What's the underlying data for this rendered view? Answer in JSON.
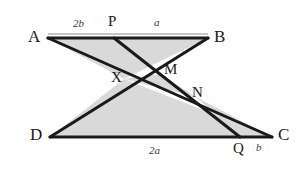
{
  "figure": {
    "background_color": "#fefefe",
    "stroke_color": "#1a1a1a",
    "fill_color": "#d9d9d9",
    "width": 306,
    "height": 170
  },
  "vertices": {
    "A": {
      "label": "A",
      "x": 48,
      "y": 38
    },
    "B": {
      "label": "B",
      "x": 208,
      "y": 38
    },
    "C": {
      "label": "C",
      "x": 272,
      "y": 137
    },
    "D": {
      "label": "D",
      "x": 50,
      "y": 137
    }
  },
  "points": {
    "P": {
      "label": "P",
      "x": 114,
      "y": 38
    },
    "Q": {
      "label": "Q",
      "x": 240,
      "y": 137
    },
    "X": {
      "label": "X",
      "x": 124,
      "y": 79
    },
    "M": {
      "label": "M",
      "x": 160,
      "y": 74
    },
    "N": {
      "label": "N",
      "x": 196,
      "y": 97
    }
  },
  "measures": {
    "ap": {
      "label": "2b",
      "segment": "A-P"
    },
    "pb": {
      "label": "a",
      "segment": "P-B"
    },
    "dq": {
      "label": "2a",
      "segment": "D-Q"
    },
    "qc": {
      "label": "b",
      "segment": "Q-C"
    }
  },
  "vertex_label_positions": {
    "A": {
      "x": 28,
      "y": 28
    },
    "B": {
      "x": 214,
      "y": 28
    },
    "C": {
      "x": 278,
      "y": 128
    },
    "D": {
      "x": 30,
      "y": 128
    }
  },
  "point_label_positions": {
    "P": {
      "x": 108,
      "y": 16
    },
    "Q": {
      "x": 234,
      "y": 142
    },
    "X": {
      "x": 112,
      "y": 72
    },
    "M": {
      "x": 164,
      "y": 64
    },
    "N": {
      "x": 192,
      "y": 86
    }
  },
  "measure_label_positions": {
    "ap": {
      "x": 73,
      "y": 20
    },
    "pb": {
      "x": 154,
      "y": 19
    },
    "dq": {
      "x": 150,
      "y": 146
    },
    "qc": {
      "x": 257,
      "y": 143
    }
  }
}
